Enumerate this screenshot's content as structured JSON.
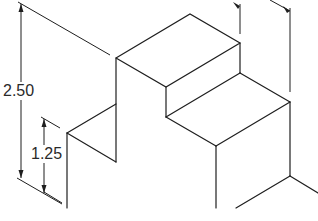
{
  "drawing": {
    "type": "isometric technical drawing",
    "description": "Stepped block with dimension lines",
    "line_color": "#1e1e1e",
    "background": "#ffffff"
  },
  "dimensions": [
    {
      "label": "2.50",
      "orientation": "vertical",
      "position": "left-outer"
    },
    {
      "label": "1.25",
      "orientation": "vertical",
      "position": "left-inner"
    }
  ]
}
